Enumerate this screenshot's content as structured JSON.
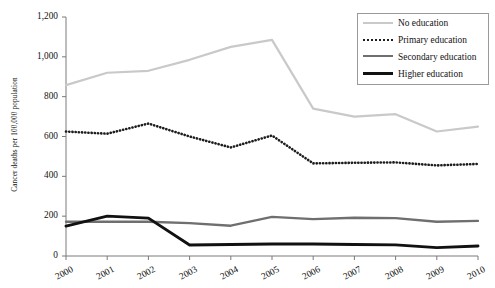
{
  "chart_data": {
    "type": "line",
    "title": "",
    "xlabel": "",
    "ylabel": "Cancer deaths per 100,000 population",
    "categories": [
      "2000",
      "2001",
      "2002",
      "2003",
      "2004",
      "2005",
      "2006",
      "2007",
      "2008",
      "2009",
      "2010"
    ],
    "x": [
      2000,
      2001,
      2002,
      2003,
      2004,
      2005,
      2006,
      2007,
      2008,
      2009,
      2010
    ],
    "ylim": [
      0,
      1200
    ],
    "yticks": [
      0,
      200,
      400,
      600,
      800,
      1000,
      1200
    ],
    "ytick_labels": [
      "0",
      "200",
      "400",
      "600",
      "800",
      "1,000",
      "1,200"
    ],
    "grid": false,
    "legend_position": "top-right",
    "series": [
      {
        "name": "No education",
        "color": "#c9c9c9",
        "style": "solid",
        "values": [
          858,
          920,
          930,
          985,
          1050,
          1085,
          740,
          700,
          712,
          625,
          650
        ]
      },
      {
        "name": "Primary education",
        "color": "#1d1d1d",
        "style": "dotted",
        "values": [
          625,
          614,
          665,
          600,
          545,
          605,
          465,
          468,
          470,
          455,
          462
        ]
      },
      {
        "name": "Secondary education",
        "color": "#6f6f6f",
        "style": "solid",
        "values": [
          172,
          172,
          172,
          165,
          152,
          196,
          185,
          192,
          190,
          172,
          176
        ]
      },
      {
        "name": "Higher education",
        "color": "#111111",
        "style": "solid",
        "values": [
          150,
          200,
          190,
          55,
          58,
          60,
          60,
          58,
          56,
          42,
          50
        ]
      }
    ]
  },
  "legend": {
    "items": [
      {
        "label": "No education"
      },
      {
        "label": "Primary education"
      },
      {
        "label": "Secondary education"
      },
      {
        "label": "Higher education"
      }
    ]
  }
}
